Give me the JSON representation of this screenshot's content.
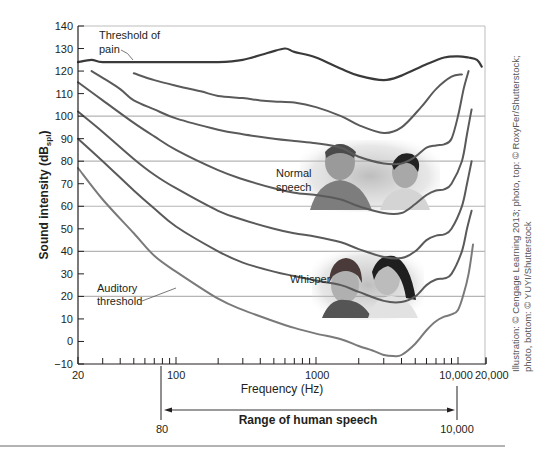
{
  "chart_data": {
    "type": "line",
    "title": "",
    "xlabel": "Frequency (Hz)",
    "ylabel": "Sound intensity (dBspl)",
    "ylabel_main": "Sound intensity (dB",
    "ylabel_sub": "spl",
    "ylabel_close": ")",
    "xscale": "log",
    "xlim": [
      20,
      20000
    ],
    "ylim": [
      -10,
      140
    ],
    "yticks": [
      -10,
      0,
      10,
      20,
      30,
      40,
      50,
      60,
      70,
      80,
      90,
      100,
      110,
      120,
      130,
      140
    ],
    "xtick_labels": [
      {
        "value": 20,
        "label": "20"
      },
      {
        "value": 100,
        "label": "100"
      },
      {
        "value": 1000,
        "label": "1000"
      },
      {
        "value": 10000,
        "label": "10,000"
      },
      {
        "value": 20000,
        "label": "20,000"
      }
    ],
    "xminor_ticks": [
      30,
      40,
      50,
      60,
      70,
      80,
      90,
      200,
      300,
      400,
      500,
      600,
      700,
      800,
      900,
      2000,
      3000,
      4000,
      5000,
      6000,
      7000,
      8000,
      9000
    ],
    "gridlines_y": [
      20,
      40,
      60,
      80,
      100
    ],
    "series": [
      {
        "name": "Threshold of pain",
        "color": "#3a3a3a",
        "width": 2.2,
        "points": [
          [
            20,
            124
          ],
          [
            25,
            125
          ],
          [
            30,
            124
          ],
          [
            50,
            124
          ],
          [
            100,
            124
          ],
          [
            200,
            124
          ],
          [
            300,
            125
          ],
          [
            450,
            128
          ],
          [
            600,
            130
          ],
          [
            700,
            128.5
          ],
          [
            1000,
            126
          ],
          [
            1500,
            121
          ],
          [
            2000,
            118
          ],
          [
            3000,
            116
          ],
          [
            4000,
            118
          ],
          [
            6000,
            123
          ],
          [
            8000,
            126
          ],
          [
            10000,
            126.5
          ],
          [
            13000,
            126
          ],
          [
            16000,
            125
          ],
          [
            18000,
            122
          ]
        ]
      },
      {
        "name": "Equal loudness 100 phon",
        "color": "#5a5a5a",
        "width": 2,
        "points": [
          [
            50,
            119
          ],
          [
            70,
            116
          ],
          [
            100,
            113.5
          ],
          [
            150,
            111
          ],
          [
            200,
            109
          ],
          [
            300,
            108
          ],
          [
            400,
            107
          ],
          [
            500,
            106.5
          ],
          [
            700,
            106
          ],
          [
            1000,
            104
          ],
          [
            1500,
            100
          ],
          [
            2000,
            96
          ],
          [
            3000,
            92.5
          ],
          [
            4000,
            95
          ],
          [
            5500,
            104
          ],
          [
            7000,
            112
          ],
          [
            9000,
            117.5
          ],
          [
            11000,
            118.5
          ]
        ]
      },
      {
        "name": "Equal loudness 90 phon",
        "color": "#5a5a5a",
        "width": 2,
        "points": [
          [
            25,
            120
          ],
          [
            30,
            117
          ],
          [
            40,
            112
          ],
          [
            50,
            107
          ],
          [
            70,
            103
          ],
          [
            100,
            99
          ],
          [
            200,
            94
          ],
          [
            300,
            92
          ],
          [
            500,
            90
          ],
          [
            700,
            89
          ],
          [
            1000,
            88
          ],
          [
            1500,
            86
          ],
          [
            2000,
            82
          ],
          [
            3000,
            79
          ],
          [
            4000,
            79
          ],
          [
            5000,
            82
          ],
          [
            6000,
            86
          ],
          [
            7000,
            87
          ],
          [
            8000,
            87.5
          ],
          [
            9000,
            90
          ],
          [
            10000,
            100
          ],
          [
            11500,
            112
          ],
          [
            13000,
            120
          ]
        ]
      },
      {
        "name": "Equal loudness 70 phon",
        "color": "#5a5a5a",
        "width": 2,
        "points": [
          [
            20,
            115
          ],
          [
            30,
            107
          ],
          [
            50,
            97
          ],
          [
            70,
            91
          ],
          [
            100,
            85
          ],
          [
            200,
            76
          ],
          [
            300,
            72
          ],
          [
            500,
            68
          ],
          [
            700,
            66
          ],
          [
            1000,
            65
          ],
          [
            1500,
            63
          ],
          [
            2000,
            60
          ],
          [
            3000,
            57
          ],
          [
            4000,
            57
          ],
          [
            5000,
            61
          ],
          [
            6000,
            65
          ],
          [
            7000,
            67
          ],
          [
            8000,
            67.5
          ],
          [
            9000,
            70
          ],
          [
            11000,
            80
          ],
          [
            12500,
            92
          ],
          [
            14000,
            103
          ]
        ]
      },
      {
        "name": "Equal loudness 50 phon",
        "color": "#5a5a5a",
        "width": 2,
        "points": [
          [
            20,
            102
          ],
          [
            30,
            93
          ],
          [
            50,
            81
          ],
          [
            70,
            74
          ],
          [
            100,
            68
          ],
          [
            200,
            58
          ],
          [
            300,
            54
          ],
          [
            500,
            50
          ],
          [
            700,
            48
          ],
          [
            1000,
            46.5
          ],
          [
            1500,
            44
          ],
          [
            2000,
            41
          ],
          [
            3000,
            37.5
          ],
          [
            4000,
            37
          ],
          [
            5000,
            40
          ],
          [
            6000,
            45
          ],
          [
            7000,
            47
          ],
          [
            8000,
            47.5
          ],
          [
            9000,
            50
          ],
          [
            11000,
            60
          ],
          [
            12500,
            70
          ],
          [
            14000,
            80
          ]
        ]
      },
      {
        "name": "Equal loudness 30 phon",
        "color": "#5a5a5a",
        "width": 2,
        "points": [
          [
            20,
            90
          ],
          [
            30,
            80
          ],
          [
            50,
            67
          ],
          [
            70,
            59
          ],
          [
            100,
            51
          ],
          [
            200,
            40
          ],
          [
            300,
            35
          ],
          [
            500,
            31
          ],
          [
            700,
            29
          ],
          [
            1000,
            27
          ],
          [
            1500,
            25
          ],
          [
            2000,
            22
          ],
          [
            3000,
            18
          ],
          [
            4000,
            17.5
          ],
          [
            5000,
            20
          ],
          [
            6000,
            25
          ],
          [
            7000,
            27.5
          ],
          [
            8000,
            28
          ],
          [
            9000,
            30
          ],
          [
            11000,
            40
          ],
          [
            12500,
            50
          ],
          [
            14000,
            58
          ]
        ]
      },
      {
        "name": "Auditory threshold",
        "color": "#7a7a7a",
        "width": 2,
        "points": [
          [
            20,
            77
          ],
          [
            30,
            63
          ],
          [
            50,
            48
          ],
          [
            70,
            38
          ],
          [
            100,
            31
          ],
          [
            200,
            19
          ],
          [
            300,
            14
          ],
          [
            500,
            9
          ],
          [
            700,
            6
          ],
          [
            1000,
            3.5
          ],
          [
            1500,
            1
          ],
          [
            2000,
            -2
          ],
          [
            2500,
            -4
          ],
          [
            3000,
            -6
          ],
          [
            3500,
            -6.5
          ],
          [
            4000,
            -6
          ],
          [
            5000,
            -1
          ],
          [
            6000,
            5
          ],
          [
            7000,
            9
          ],
          [
            8000,
            11
          ],
          [
            9000,
            12
          ],
          [
            10000,
            14
          ],
          [
            11500,
            21
          ],
          [
            13000,
            30
          ],
          [
            14500,
            43
          ]
        ]
      }
    ],
    "annotations": [
      {
        "text_lines": [
          "Threshold of",
          "pain"
        ],
        "leader_to": [
          200,
          124
        ]
      },
      {
        "text_lines": [
          "Normal",
          "speech"
        ]
      },
      {
        "text_lines": [
          "Whisper"
        ]
      },
      {
        "text_lines": [
          "Auditory",
          "threshold"
        ],
        "leader_to": [
          130,
          27
        ]
      }
    ],
    "range_bracket": {
      "label": "Range of human speech",
      "from": 80,
      "to": 10000,
      "from_label": "80",
      "to_label": "10,000"
    }
  },
  "labels": {
    "pain_line1": "Threshold of",
    "pain_line2": "pain",
    "normal_line1": "Normal",
    "normal_line2": "speech",
    "whisper": "Whisper",
    "audit_line1": "Auditory",
    "audit_line2": "threshold",
    "xlabel": "Frequency (Hz)",
    "range_label": "Range of human speech",
    "range_from": "80",
    "range_to": "10,000"
  },
  "credit": {
    "line1": "Illustration: © Cengage Learning 2013; photo, top: © RoxyFer/Shutterstock;",
    "line2": "photo, bottom: © YUYI/Shutterstock"
  },
  "photos": {
    "top": "Two young men talking (normal speech)",
    "bottom": "Two young women whispering"
  }
}
